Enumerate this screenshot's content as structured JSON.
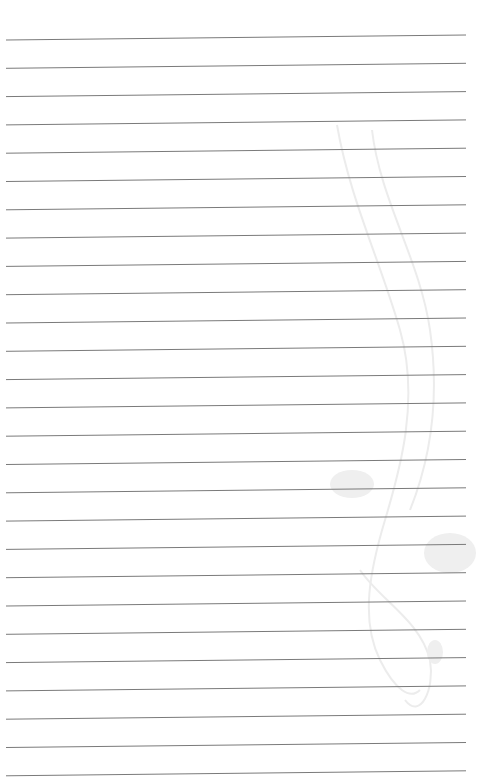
{
  "page": {
    "type": "lined-paper",
    "background": "#ffffff",
    "line_color": "#7a7a7a",
    "line_count": 27,
    "first_line_y": 40,
    "line_spacing": 28.3,
    "line_x_start": 6,
    "line_x_end": 466,
    "line_tilt_px": -5,
    "watermark": "decorative-swirl"
  }
}
